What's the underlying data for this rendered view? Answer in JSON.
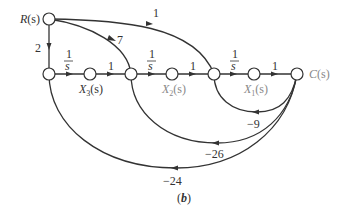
{
  "figure": {
    "caption": "(b)",
    "caption_letter": "b",
    "type": "signal-flow-graph"
  },
  "nodes": {
    "input": {
      "label": "R(s)",
      "name": "R",
      "arg": "(s)"
    },
    "output": {
      "label": "C(s)",
      "name": "C",
      "arg": "(s)"
    },
    "x3": {
      "label": "X3(s)",
      "name": "X",
      "sub": "3",
      "arg": "(s)"
    },
    "x2": {
      "label": "X2(s)",
      "name": "X",
      "sub": "2",
      "arg": "(s)"
    },
    "x1": {
      "label": "X1(s)",
      "name": "X",
      "sub": "1",
      "arg": "(s)"
    }
  },
  "branches": {
    "r_to_n1": {
      "gain": "2"
    },
    "r_to_n3": {
      "gain": "7"
    },
    "r_to_n5": {
      "gain": "1"
    },
    "n1_to_x3": {
      "gain_num": "1",
      "gain_den": "s"
    },
    "x3_to_n3": {
      "gain": "1"
    },
    "n3_to_x2": {
      "gain_num": "1",
      "gain_den": "s"
    },
    "x2_to_n5": {
      "gain": "1"
    },
    "n5_to_x1": {
      "gain_num": "1",
      "gain_den": "s"
    },
    "x1_to_c": {
      "gain": "1"
    },
    "c_to_n5": {
      "gain": "−9"
    },
    "c_to_n3": {
      "gain": "−26"
    },
    "c_to_n1": {
      "gain": "−24"
    }
  }
}
